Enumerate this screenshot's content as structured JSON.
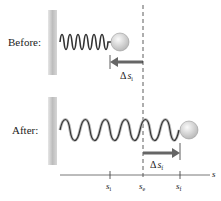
{
  "figure": {
    "before_label": "Before:",
    "after_label": "After:",
    "delta_si": {
      "delta": "Δ",
      "s": "s",
      "sub": "i"
    },
    "delta_sf": {
      "delta": "Δ",
      "s": "s",
      "sub": "f"
    },
    "axis": {
      "label": "s",
      "ticks": [
        {
          "s": "s",
          "sub": "i"
        },
        {
          "s": "s",
          "sub": "e"
        },
        {
          "s": "s",
          "sub": "f"
        }
      ]
    },
    "colors": {
      "wall": "#c8c8c8",
      "spring_dark": "#333333",
      "spring_light": "#bbbbbb",
      "ball": "#dcdcdc",
      "arrow": "#666666",
      "dashed_line": "#333333"
    }
  }
}
